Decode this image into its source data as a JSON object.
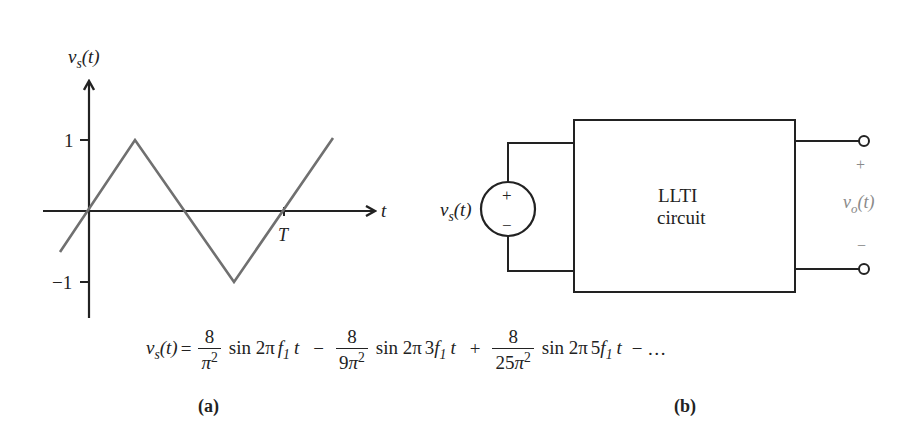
{
  "figure": {
    "panel_a": {
      "caption": "(a)",
      "y_axis_label": {
        "var": "v",
        "sub": "s",
        "arg": "(t)"
      },
      "x_axis_label": "t",
      "y_ticks": [
        "1",
        "−1"
      ],
      "x_tick_label": "T",
      "waveform": {
        "type": "triangle",
        "amplitude": 1,
        "period_label": "T",
        "points_px": [
          [
            60,
            252
          ],
          [
            135,
            140
          ],
          [
            234,
            282
          ],
          [
            333,
            138
          ]
        ],
        "stroke": "#707070"
      }
    },
    "panel_b": {
      "caption": "(b)",
      "source_label": {
        "var": "v",
        "sub": "s",
        "arg": "(t)"
      },
      "source_plus": "+",
      "source_minus": "−",
      "block_line1": "LLTI",
      "block_line2": "circuit",
      "output_plus": "+",
      "output_minus": "−",
      "output_label": {
        "var": "v",
        "sub": "o",
        "arg": "(t)"
      }
    },
    "equation": {
      "lhs": {
        "var": "v",
        "sub": "s",
        "arg": "(t)",
        "eq": "="
      },
      "terms": [
        {
          "sign": "",
          "num": "8",
          "den_coef": "",
          "den_sym": "π",
          "den_pow": "2",
          "fn": "sin 2π",
          "harm": "",
          "f": "f",
          "f_sub": "1",
          "t": "t"
        },
        {
          "sign": "−",
          "num": "8",
          "den_coef": "9",
          "den_sym": "π",
          "den_pow": "2",
          "fn": "sin 2π",
          "harm": "3",
          "f": "f",
          "f_sub": "1",
          "t": "t"
        },
        {
          "sign": "+",
          "num": "8",
          "den_coef": "25",
          "den_sym": "π",
          "den_pow": "2",
          "fn": "sin 2π",
          "harm": "5",
          "f": "f",
          "f_sub": "1",
          "t": "t"
        }
      ],
      "tail": "− …"
    }
  }
}
